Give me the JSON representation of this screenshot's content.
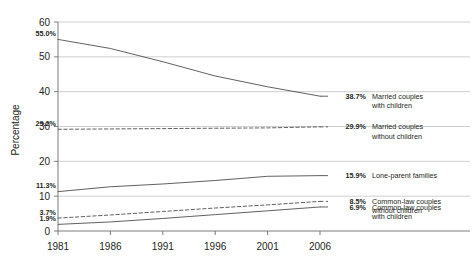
{
  "chart_data": {
    "type": "line",
    "title": "",
    "xlabel": "",
    "ylabel": "Percentage",
    "x": [
      1981,
      1986,
      1991,
      1996,
      2001,
      2006
    ],
    "xtick_labels": [
      "1981",
      "1986",
      "1991",
      "1996",
      "2001",
      "2006"
    ],
    "ytick_labels": [
      "0",
      "10",
      "20",
      "30",
      "40",
      "50",
      "60"
    ],
    "yticks": [
      0,
      10,
      20,
      30,
      40,
      50,
      60
    ],
    "ylim": [
      0,
      60
    ],
    "xlim": [
      1981,
      2006
    ],
    "grid": "horizontal",
    "legend": "right-inline-labels",
    "series": [
      {
        "name": "Married couples with children",
        "name_line1": "Married couples",
        "name_line2": "with children",
        "style": "solid",
        "color": "#58595b",
        "values": [
          55.0,
          52.4,
          48.6,
          44.5,
          41.4,
          38.7
        ],
        "start_label": "55.0%",
        "end_label": "38.7%"
      },
      {
        "name": "Married couples without children",
        "name_line1": "Married couples",
        "name_line2": "without children",
        "style": "dashed",
        "color": "#58595b",
        "values": [
          29.2,
          29.3,
          29.4,
          29.5,
          29.6,
          29.9
        ],
        "start_label": "29.2%",
        "end_label": "29.9%"
      },
      {
        "name": "Lone-parent families",
        "name_line1": "Lone-parent families",
        "name_line2": "",
        "style": "solid",
        "color": "#58595b",
        "values": [
          11.3,
          12.7,
          13.5,
          14.5,
          15.7,
          15.9
        ],
        "start_label": "11.3%",
        "end_label": "15.9%"
      },
      {
        "name": "Common-law couples without children",
        "name_line1": "Common-law couples",
        "name_line2": "without children",
        "style": "dashed",
        "color": "#58595b",
        "values": [
          3.7,
          4.6,
          5.6,
          6.6,
          7.5,
          8.5
        ],
        "start_label": "3.7%",
        "end_label": "8.5%"
      },
      {
        "name": "Common-law couples with children",
        "name_line1": "Common-law couples",
        "name_line2": "with children",
        "style": "solid",
        "color": "#58595b",
        "values": [
          1.9,
          2.6,
          3.6,
          4.7,
          5.8,
          6.9
        ],
        "start_label": "1.9%",
        "end_label": "6.9%"
      }
    ]
  },
  "colors": {
    "line": "#58595b",
    "grid": "#c9cacc",
    "axis": "#6d6e71",
    "text": "#231f20",
    "background": "#ffffff"
  }
}
